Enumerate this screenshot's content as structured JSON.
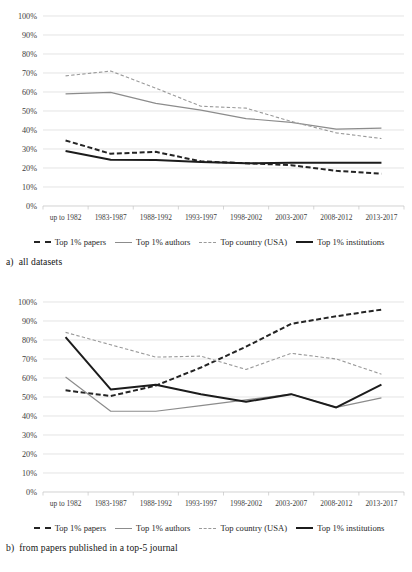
{
  "figure": {
    "panels": [
      {
        "caption_index": "a)",
        "caption_text": "all datasets"
      },
      {
        "caption_index": "b)",
        "caption_text": "from papers published in a top-5 journal"
      }
    ]
  },
  "legend": {
    "items": [
      {
        "label": "Top 1% papers",
        "style": "dashed",
        "color": "#242424",
        "swatch": "sw-dash-dark"
      },
      {
        "label": "Top 1% authors",
        "style": "solid",
        "color": "#8c8c8c",
        "swatch": "sw-solid-gray"
      },
      {
        "label": "Top country (USA)",
        "style": "dashed",
        "color": "#9a9a9a",
        "swatch": "sw-dash-gray"
      },
      {
        "label": "Top 1% institutions",
        "style": "solid",
        "color": "#1c1c1c",
        "swatch": "sw-solid-dark"
      }
    ]
  },
  "chart_data": [
    {
      "type": "line",
      "title": "a) all datasets",
      "xlabel": "",
      "ylabel": "",
      "ylim": [
        0,
        100
      ],
      "ytick_labels": [
        "0%",
        "10%",
        "20%",
        "30%",
        "40%",
        "50%",
        "60%",
        "70%",
        "80%",
        "90%",
        "100%"
      ],
      "yticks": [
        0,
        10,
        20,
        30,
        40,
        50,
        60,
        70,
        80,
        90,
        100
      ],
      "grid": true,
      "legend_position": "bottom",
      "categories": [
        "up to 1982",
        "1983-1987",
        "1988-1992",
        "1993-1997",
        "1998-2002",
        "2003-2007",
        "2008-2012",
        "2013-2017"
      ],
      "series": [
        {
          "name": "Top 1% papers",
          "color": "#242424",
          "style": "dashed",
          "width": 2.0,
          "values": [
            34.5,
            27.5,
            28.5,
            23.5,
            22.5,
            21.5,
            18.5,
            17.0
          ]
        },
        {
          "name": "Top 1% authors",
          "color": "#8c8c8c",
          "style": "solid",
          "width": 1.2,
          "values": [
            59.0,
            59.8,
            54.0,
            50.5,
            46.0,
            44.0,
            40.5,
            41.0
          ]
        },
        {
          "name": "Top country (USA)",
          "color": "#9a9a9a",
          "style": "dashed",
          "width": 1.1,
          "values": [
            68.5,
            71.0,
            62.0,
            52.5,
            51.5,
            44.5,
            38.5,
            35.5
          ]
        },
        {
          "name": "Top 1% institutions",
          "color": "#1c1c1c",
          "style": "solid",
          "width": 2.0,
          "values": [
            29.0,
            24.3,
            24.2,
            23.2,
            22.5,
            22.7,
            22.8,
            22.8
          ]
        }
      ]
    },
    {
      "type": "line",
      "title": "b) from papers published in a top-5 journal",
      "xlabel": "",
      "ylabel": "",
      "ylim": [
        0,
        100
      ],
      "ytick_labels": [
        "0%",
        "10%",
        "20%",
        "30%",
        "40%",
        "50%",
        "60%",
        "70%",
        "80%",
        "90%",
        "100%"
      ],
      "yticks": [
        0,
        10,
        20,
        30,
        40,
        50,
        60,
        70,
        80,
        90,
        100
      ],
      "grid": true,
      "legend_position": "bottom",
      "categories": [
        "up to 1982",
        "1983-1987",
        "1988-1992",
        "1993-1997",
        "1998-2002",
        "2003-2007",
        "2008-2012",
        "2013-2017"
      ],
      "series": [
        {
          "name": "Top 1% papers",
          "color": "#242424",
          "style": "dashed",
          "width": 2.0,
          "values": [
            53.5,
            50.5,
            56.0,
            65.5,
            76.5,
            88.5,
            92.5,
            96.0
          ]
        },
        {
          "name": "Top 1% authors",
          "color": "#8c8c8c",
          "style": "solid",
          "width": 1.2,
          "values": [
            60.5,
            42.5,
            42.5,
            45.5,
            48.5,
            51.5,
            44.5,
            49.5
          ]
        },
        {
          "name": "Top country (USA)",
          "color": "#9a9a9a",
          "style": "dashed",
          "width": 1.1,
          "values": [
            84.0,
            77.5,
            71.0,
            71.5,
            64.5,
            73.0,
            70.0,
            62.0
          ]
        },
        {
          "name": "Top 1% institutions",
          "color": "#1c1c1c",
          "style": "solid",
          "width": 2.0,
          "values": [
            81.5,
            54.0,
            56.5,
            51.5,
            47.5,
            51.5,
            44.5,
            56.5
          ]
        }
      ]
    }
  ]
}
